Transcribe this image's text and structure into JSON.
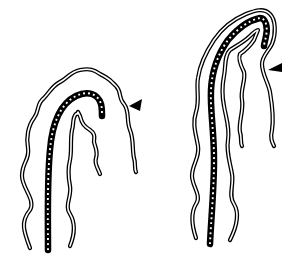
{
  "figure": {
    "panels": [
      {
        "id": "left",
        "scope_tip_marker": "arrowhead",
        "arrow_direction": "left"
      },
      {
        "id": "right",
        "scope_tip_marker": "arrowhead",
        "arrow_direction": "left"
      }
    ],
    "colors": {
      "line": "#000000",
      "background": "#ffffff",
      "scope_dots": "#ffffff"
    },
    "labels": []
  }
}
